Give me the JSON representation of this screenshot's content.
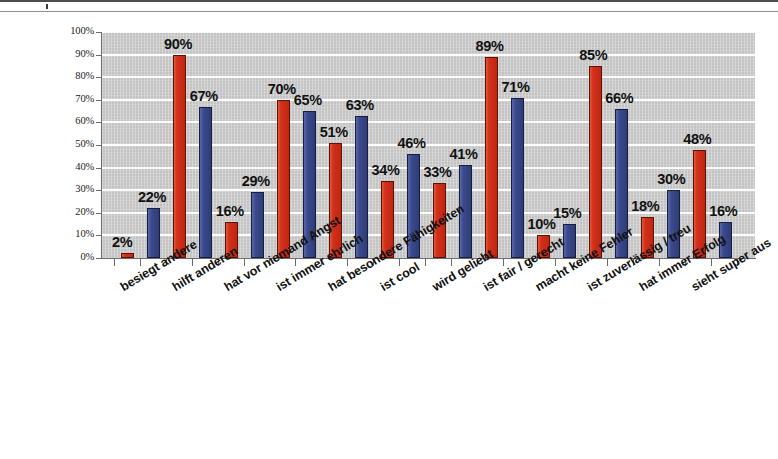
{
  "chart_data": {
    "type": "bar",
    "title": "",
    "subtitle": "",
    "xlabel": "",
    "ylabel": "",
    "ylim": [
      0,
      100
    ],
    "grid": true,
    "legend_position": "none",
    "value_label_format": "percent",
    "categories": [
      "besiegt andere",
      "hilft anderen",
      "hat vor niemand Angst",
      "ist immer ehrlich",
      "hat besondere Fähigkeiten",
      "ist cool",
      "wird geliebt",
      "ist fair / gerecht",
      "macht keine Fehler",
      "ist zuverlässig / treu",
      "hat immer Erfolg",
      "sieht super aus"
    ],
    "tick_labels": [
      "0%",
      "10%",
      "20%",
      "30%",
      "40%",
      "50%",
      "60%",
      "70%",
      "80%",
      "90%",
      "100%"
    ],
    "tick_values": [
      0,
      10,
      20,
      30,
      40,
      50,
      60,
      70,
      80,
      90,
      100
    ],
    "series": [
      {
        "name": "red-series",
        "color": "#c9291a",
        "values": [
          2,
          90,
          16,
          70,
          51,
          34,
          33,
          89,
          10,
          85,
          18,
          48
        ],
        "labels": [
          "2%",
          "90%",
          "16%",
          "70%",
          "51%",
          "34%",
          "33%",
          "89%",
          "10%",
          "85%",
          "18%",
          "48%"
        ]
      },
      {
        "name": "blue-series",
        "color": "#36457f",
        "values": [
          22,
          67,
          29,
          65,
          63,
          46,
          41,
          71,
          15,
          66,
          30,
          16
        ],
        "labels": [
          "22%",
          "67%",
          "29%",
          "65%",
          "63%",
          "46%",
          "41%",
          "71%",
          "15%",
          "66%",
          "30%",
          "16%"
        ]
      }
    ]
  },
  "colors": {
    "red": "#c9291a",
    "blue": "#36457f",
    "plot_background": "#c9c9c9",
    "gridline": "#fdfdfd",
    "axis": "#6b6b6b",
    "text": "#111111",
    "page_background": "#ffffff"
  }
}
